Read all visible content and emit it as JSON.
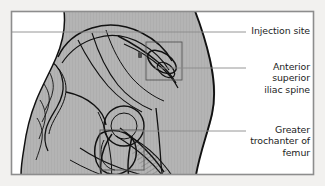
{
  "figure": {
    "frame": {
      "page_background": "#f2f1ef",
      "border_color": "#8d8d8d",
      "inner_background": "#ffffff"
    },
    "anatomy": {
      "body_fill": "#b3b3b3",
      "body_outline": "#111111",
      "bone_line_color": "#111111",
      "hatch_color": "#333333",
      "marker_color": "#4a4a4a",
      "marker_name": "injection-site-dot"
    },
    "callout_boxes": [
      {
        "name": "injection-site-box",
        "color": "#555555"
      },
      {
        "name": "greater-trochanter-box",
        "color": "#555555"
      }
    ],
    "leader_line_color": "#8a8a8a",
    "labels": [
      {
        "id": "injection-site",
        "text": "Injection site",
        "leader_y": 32
      },
      {
        "id": "anterior-superior-iliac-spine",
        "text": "Anterior\nsuperior\niliac spine",
        "leader_y": 68
      },
      {
        "id": "greater-trochanter-of-femur",
        "text": "Greater\ntrochanter of\nfemur",
        "leader_y": 131
      }
    ]
  }
}
